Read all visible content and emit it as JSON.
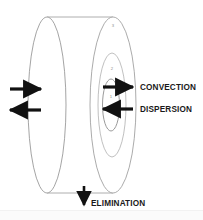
{
  "figure": {
    "type": "compartment-cylinder-diagram",
    "background_color": "#ffffff",
    "stroke_color": "#9a9a9a",
    "arrow_color": "#111111",
    "text_color": "#1a1a1a"
  },
  "cylinder": {
    "name": "drum-cylinder",
    "left_face_label": "",
    "right_face_label": ""
  },
  "regions": [
    {
      "id": "region-outer",
      "number": "3",
      "cx": 113,
      "cy": 105,
      "rx": 23,
      "ry": 88
    },
    {
      "id": "region-middle",
      "number": "2",
      "cx": 112,
      "cy": 105,
      "rx": 14,
      "ry": 52
    },
    {
      "id": "region-inner",
      "number": "1",
      "cx": 111,
      "cy": 105,
      "rx": 8.5,
      "ry": 26
    }
  ],
  "arrows": {
    "inflow": {
      "label": "",
      "direction": "right"
    },
    "outflow": {
      "label": "",
      "direction": "left"
    },
    "convection": {
      "label": "CONVECTION",
      "direction": "right"
    },
    "dispersion": {
      "label": "DISPERSION",
      "direction": "left"
    },
    "elimination": {
      "label": "ELIMINATION",
      "direction": "down"
    }
  },
  "caption": {
    "text": ""
  }
}
